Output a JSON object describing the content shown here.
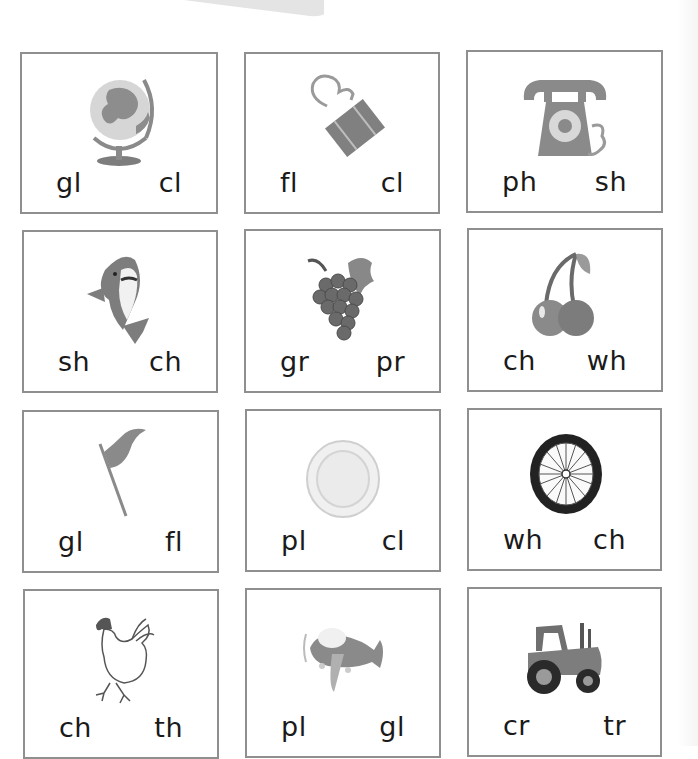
{
  "worksheet": {
    "colors": {
      "card_border": "#8f8f8f",
      "picture_gray": "#8a8a8a",
      "text": "#1a1a1a"
    },
    "cards": [
      {
        "picture": "globe",
        "options": [
          "gl",
          "cl"
        ]
      },
      {
        "picture": "binder-clip",
        "options": [
          "fl",
          "cl"
        ]
      },
      {
        "picture": "telephone",
        "options": [
          "ph",
          "sh"
        ]
      },
      {
        "picture": "shark",
        "options": [
          "sh",
          "ch"
        ]
      },
      {
        "picture": "grapes",
        "options": [
          "gr",
          "pr"
        ]
      },
      {
        "picture": "cherries",
        "options": [
          "ch",
          "wh"
        ]
      },
      {
        "picture": "flag",
        "options": [
          "gl",
          "fl"
        ]
      },
      {
        "picture": "plate",
        "options": [
          "pl",
          "cl"
        ]
      },
      {
        "picture": "wheel",
        "options": [
          "wh",
          "ch"
        ]
      },
      {
        "picture": "chicken",
        "options": [
          "ch",
          "th"
        ]
      },
      {
        "picture": "plane",
        "options": [
          "pl",
          "gl"
        ]
      },
      {
        "picture": "tractor",
        "options": [
          "cr",
          "tr"
        ]
      }
    ]
  }
}
